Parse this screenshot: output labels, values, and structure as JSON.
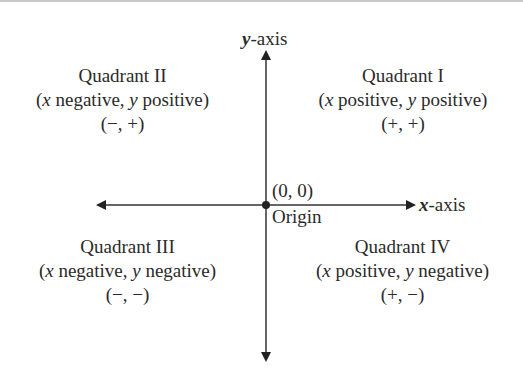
{
  "diagram": {
    "y_axis_label": {
      "var": "y",
      "suffix": "-axis"
    },
    "x_axis_label": {
      "var": "x",
      "suffix": "-axis"
    },
    "origin": {
      "coords": "(0, 0)",
      "label": "Origin"
    },
    "quadrants": [
      {
        "name": "Quadrant I",
        "desc_x": "x",
        "desc_x_sign": " positive, ",
        "desc_y": "y",
        "desc_y_sign": " positive)",
        "signs": "(+, +)"
      },
      {
        "name": "Quadrant II",
        "desc_x": "x",
        "desc_x_sign": " negative, ",
        "desc_y": "y",
        "desc_y_sign": " positive)",
        "signs": "(−, +)"
      },
      {
        "name": "Quadrant III",
        "desc_x": "x",
        "desc_x_sign": " negative, ",
        "desc_y": "y",
        "desc_y_sign": " negative)",
        "signs": "(−, −)"
      },
      {
        "name": "Quadrant IV",
        "desc_x": "x",
        "desc_x_sign": " positive, ",
        "desc_y": "y",
        "desc_y_sign": " negative)",
        "signs": "(+, −)"
      }
    ],
    "open_paren": "("
  }
}
